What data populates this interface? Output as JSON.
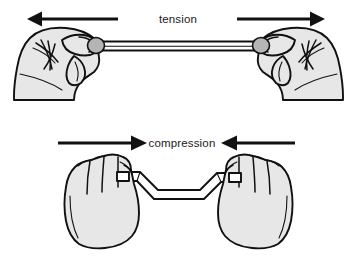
{
  "figure": {
    "background_color": "#ffffff",
    "ink_color": "#111111",
    "skin_fill_color": "#e7e7e7",
    "thumb_fill_color": "#b5b5b5",
    "rod_fill_color": "#ffffff"
  },
  "panels": [
    {
      "id": "tension",
      "label": "tension",
      "label_x": 178,
      "label_y": 19,
      "arrow_direction_left": "left",
      "arrow_direction_right": "right",
      "rod_state": "straight",
      "hand_pose": "pinch-grip",
      "description": "two hands pulling a straight rod apart"
    },
    {
      "id": "compression",
      "label": "compression",
      "label_x": 178,
      "label_y": 143,
      "arrow_direction_left": "right",
      "arrow_direction_right": "left",
      "rod_state": "buckled",
      "hand_pose": "closed-fist",
      "description": "two fists pushing a rod together until it buckles"
    }
  ],
  "arrows": {
    "tension_left": {
      "from_x": 118,
      "to_x": 31,
      "y": 19
    },
    "tension_right": {
      "from_x": 237,
      "to_x": 323,
      "y": 19
    },
    "compression_left": {
      "from_x": 58,
      "to_x": 146,
      "y": 143
    },
    "compression_right": {
      "from_x": 295,
      "to_x": 222,
      "y": 143
    }
  }
}
